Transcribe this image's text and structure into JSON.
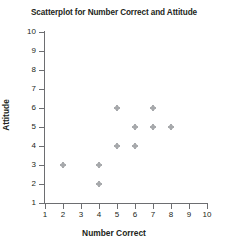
{
  "chart_data": {
    "type": "scatter",
    "title": "Scatterplot for Number Correct and Attitude",
    "xlabel": "Number Correct",
    "ylabel": "Attitude",
    "xlim": [
      1,
      10
    ],
    "ylim": [
      1,
      10
    ],
    "xticks": [
      1,
      2,
      3,
      4,
      5,
      6,
      7,
      8,
      9,
      10
    ],
    "yticks": [
      1,
      2,
      3,
      4,
      5,
      6,
      7,
      8,
      9,
      10
    ],
    "grid": false,
    "legend": null,
    "marker_color": "#58595b",
    "axis_color": "#6d6e71",
    "points": [
      {
        "x": 2,
        "y": 3
      },
      {
        "x": 4,
        "y": 3
      },
      {
        "x": 4,
        "y": 2
      },
      {
        "x": 5,
        "y": 6
      },
      {
        "x": 5,
        "y": 4
      },
      {
        "x": 6,
        "y": 5
      },
      {
        "x": 6,
        "y": 4
      },
      {
        "x": 7,
        "y": 6
      },
      {
        "x": 7,
        "y": 5
      },
      {
        "x": 8,
        "y": 5
      }
    ]
  }
}
